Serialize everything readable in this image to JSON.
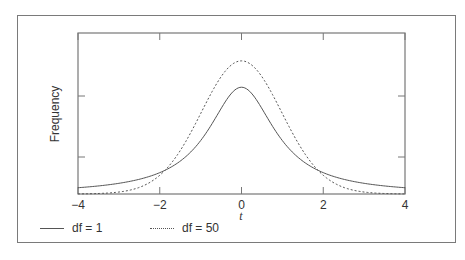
{
  "chart_data": {
    "type": "line",
    "title": "",
    "xlabel": "t",
    "ylabel": "Frequency",
    "xlim": [
      -4,
      4
    ],
    "xticks": [
      -4,
      -2,
      0,
      2,
      4
    ],
    "xtick_labels": [
      "−4",
      "−2",
      "0",
      "2",
      "4"
    ],
    "yticks_unlabeled": true,
    "grid": false,
    "legend_position": "bottom",
    "series": [
      {
        "name": "df = 1",
        "style": "solid",
        "color": "#555555",
        "x": [
          -4,
          -3,
          -2,
          -1.5,
          -1,
          -0.5,
          0,
          0.5,
          1,
          1.5,
          2,
          3,
          4
        ],
        "y": [
          0.019,
          0.032,
          0.064,
          0.098,
          0.159,
          0.255,
          0.318,
          0.255,
          0.159,
          0.098,
          0.064,
          0.032,
          0.019
        ]
      },
      {
        "name": "df = 50",
        "style": "dotted",
        "color": "#555555",
        "x": [
          -4,
          -3,
          -2,
          -1.5,
          -1,
          -0.5,
          0,
          0.5,
          1,
          1.5,
          2,
          3,
          4
        ],
        "y": [
          0.0002,
          0.005,
          0.055,
          0.129,
          0.24,
          0.35,
          0.397,
          0.35,
          0.24,
          0.129,
          0.055,
          0.005,
          0.0002
        ]
      }
    ]
  },
  "legend": {
    "items": [
      {
        "label": "df = 1"
      },
      {
        "label": "df = 50"
      }
    ]
  },
  "axis": {
    "ylabel": "Frequency",
    "xlabel": "t"
  }
}
